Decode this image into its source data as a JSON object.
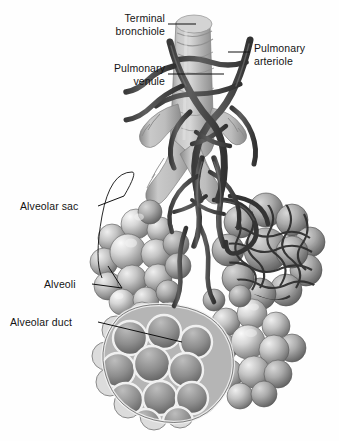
{
  "figure": {
    "background_color": "#fefefe",
    "label_text_color": "#141414",
    "leader_line_color": "#101010",
    "palette": {
      "vessel_dark": "#4a4a4a",
      "vessel_darker": "#3a3a3a",
      "bronchiole_light": "#c9c9c9",
      "bronchiole_mid": "#a8a8a8",
      "alveoli_light": "#e2e2e2",
      "alveoli_mid": "#9e9e9e",
      "alveoli_shadow": "#6e6e6e",
      "capillary_mesh": "#3d3d3d"
    }
  },
  "labels": [
    {
      "id": "terminal-bronchiole",
      "text": "Terminal\nbronchiole",
      "align": "right",
      "x": 60,
      "y": 12,
      "width": 105
    },
    {
      "id": "pulmonary-venule",
      "text": "Pulmonary\nvenule",
      "align": "right",
      "x": 60,
      "y": 62,
      "width": 105
    },
    {
      "id": "pulmonary-arteriole",
      "text": "Pulmonary\narteriole",
      "align": "left",
      "x": 254,
      "y": 42,
      "width": 85
    },
    {
      "id": "alveolar-sac",
      "text": "Alveolar sac",
      "align": "left",
      "x": 20,
      "y": 200,
      "width": 80
    },
    {
      "id": "alveoli",
      "text": "Alveoli",
      "align": "left",
      "x": 44,
      "y": 278,
      "width": 50
    },
    {
      "id": "alveolar-duct",
      "text": "Alveolar duct",
      "align": "left",
      "x": 10,
      "y": 316,
      "width": 90
    }
  ],
  "structures": [
    {
      "id": "terminal-bronchiole-trunk",
      "name": "terminal bronchiole airway trunk"
    },
    {
      "id": "pulmonary-arteriole-vessel",
      "name": "pulmonary arteriole"
    },
    {
      "id": "pulmonary-venule-vessel",
      "name": "pulmonary venule"
    },
    {
      "id": "alveolar-sac-left",
      "name": "left alveolar sac cluster"
    },
    {
      "id": "alveolar-sac-right-capillary",
      "name": "right alveolar sac with capillary network"
    },
    {
      "id": "alveolar-sac-bottom-cutaway",
      "name": "bottom alveolar sac cutaway showing alveolar duct"
    },
    {
      "id": "alveolar-sac-bottom-right",
      "name": "bottom right alveolar sac cluster"
    }
  ]
}
